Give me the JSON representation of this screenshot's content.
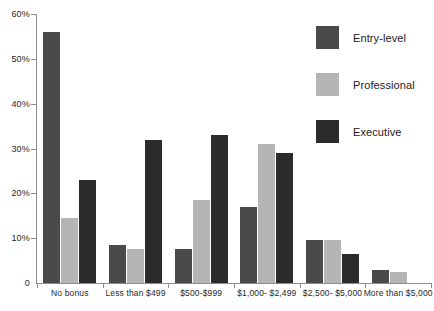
{
  "chart_data": {
    "type": "bar",
    "title": "",
    "subtitle": "",
    "xlabel": "",
    "ylabel": "",
    "ylim": [
      0,
      60
    ],
    "ytick_values": [
      0,
      10,
      20,
      30,
      40,
      50,
      60
    ],
    "ytick_labels": [
      "0",
      "10%",
      "20%",
      "30%",
      "40%",
      "50%",
      "60%"
    ],
    "grid": false,
    "legend_position": "top-right",
    "categories": [
      "No bonus",
      "Less than $499",
      "$500-$999",
      "$1,000- $2,499",
      "$2,500- $5,000",
      "More than $5,000"
    ],
    "series": [
      {
        "name": "Entry-level",
        "color": "#4a4a4a",
        "values": [
          56,
          8.5,
          7.5,
          17,
          9.5,
          3
        ]
      },
      {
        "name": "Professional",
        "color": "#b5b5b5",
        "values": [
          14.5,
          7.5,
          18.5,
          31,
          9.5,
          2.5
        ]
      },
      {
        "name": "Executive",
        "color": "#2b2b2b",
        "values": [
          23,
          32,
          33,
          29,
          6.5,
          0
        ]
      }
    ]
  },
  "axis": {
    "line_color": "#8d8d8d"
  }
}
